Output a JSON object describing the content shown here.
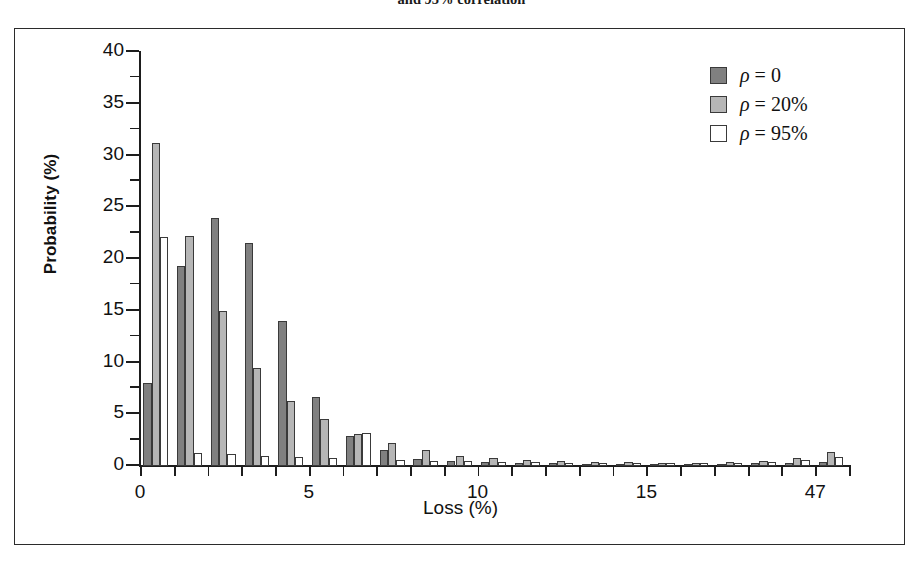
{
  "caption": "and 95% correlation",
  "chart_data": {
    "type": "bar",
    "title": "and 95% correlation",
    "xlabel": "Loss (%)",
    "ylabel": "Probability (%)",
    "ylim": [
      0,
      40
    ],
    "xlim": [
      0,
      21
    ],
    "grid": false,
    "legend_position": "top-right",
    "y_ticks": [
      0,
      5,
      10,
      15,
      20,
      25,
      30,
      35,
      40
    ],
    "y_tick_labels": [
      "0",
      "5",
      "10",
      "15",
      "20",
      "25",
      "30",
      "35",
      "40"
    ],
    "y_minor_ticks": [
      2.5,
      7.5,
      12.5,
      17.5,
      22.5,
      27.5,
      32.5,
      37.5
    ],
    "x_ticks": [
      0,
      5,
      10,
      15,
      20
    ],
    "x_tick_labels": [
      "0",
      "5",
      "10",
      "15",
      "47"
    ],
    "categories": [
      "0.5",
      "1.5",
      "2.5",
      "3.5",
      "4.5",
      "5.5",
      "6.5",
      "7.5",
      "8.5",
      "9.5",
      "10.5",
      "11.5",
      "12.5",
      "13.5",
      "14.5",
      "15.5",
      "16.5",
      "17.5",
      "18.5",
      "19.5",
      "20.5"
    ],
    "series": [
      {
        "name": "rho = 0",
        "color": "#808080",
        "values": [
          8.0,
          19.3,
          24.0,
          21.5,
          14.0,
          6.7,
          2.9,
          1.5,
          0.7,
          0.5,
          0.4,
          0.3,
          0.25,
          0.2,
          0.15,
          0.12,
          0.1,
          0.1,
          0.25,
          0.3,
          0.35
        ]
      },
      {
        "name": "rho = 20%",
        "color": "#b6b6b6",
        "values": [
          31.2,
          22.2,
          15.0,
          9.5,
          6.3,
          4.5,
          3.1,
          2.2,
          1.5,
          1.0,
          0.8,
          0.6,
          0.5,
          0.4,
          0.35,
          0.3,
          0.3,
          0.35,
          0.5,
          0.8,
          1.4
        ]
      },
      {
        "name": "rho = 95%",
        "color": "#ffffff",
        "values": [
          22.1,
          1.3,
          1.2,
          1.0,
          0.9,
          0.8,
          3.2,
          0.6,
          0.5,
          0.45,
          0.4,
          0.35,
          0.3,
          0.3,
          0.25,
          0.25,
          0.25,
          0.3,
          0.4,
          0.6,
          0.9
        ]
      }
    ]
  },
  "legend": {
    "items": [
      {
        "symbol": "ρ",
        "text": " = 0",
        "color": "#808080"
      },
      {
        "symbol": "ρ",
        "text": " = 20%",
        "color": "#b6b6b6"
      },
      {
        "symbol": "ρ",
        "text": " = 95%",
        "color": "#ffffff"
      }
    ]
  }
}
